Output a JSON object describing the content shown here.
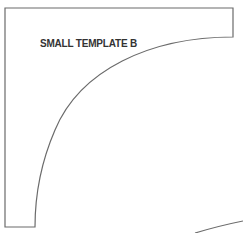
{
  "template": {
    "label": "SMALL TEMPLATE B",
    "stroke_color": "#6b6b6b",
    "text_color": "#333333",
    "background": "#ffffff"
  },
  "shapes": [
    {
      "name": "template-b-outline",
      "type": "quarter-arc-strip"
    },
    {
      "name": "partial-arc",
      "type": "arc-segment"
    }
  ]
}
